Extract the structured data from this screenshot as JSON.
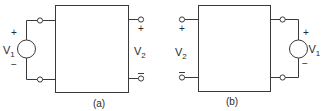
{
  "figure": {
    "stroke_color": "#3a3a3a",
    "background": "#ffffff",
    "panels": [
      {
        "id": "a",
        "caption": "(a)",
        "source": {
          "name": "V",
          "subscript": "1",
          "plus": "+",
          "minus": "−",
          "side": "left"
        },
        "output": {
          "name": "V",
          "subscript": "2",
          "plus": "+",
          "minus": "−",
          "side": "right"
        }
      },
      {
        "id": "b",
        "caption": "(b)",
        "source": {
          "name": "V",
          "subscript": "1",
          "plus": "+",
          "minus": "−",
          "side": "right"
        },
        "output": {
          "name": "V",
          "subscript": "2",
          "plus": "+",
          "minus": "−",
          "side": "left"
        }
      }
    ]
  }
}
